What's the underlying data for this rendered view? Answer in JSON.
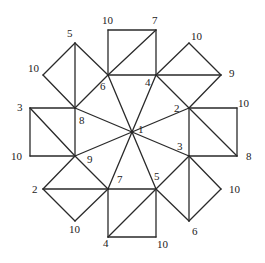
{
  "diagram": {
    "type": "graph",
    "vertices": [
      {
        "id": "c",
        "label": "1",
        "x": 132,
        "y": 132,
        "lx": 138,
        "ly": 133
      },
      {
        "id": "o6",
        "label": "6",
        "x": 108,
        "y": 75,
        "lx": 100,
        "ly": 90
      },
      {
        "id": "o4",
        "label": "4",
        "x": 156,
        "y": 75,
        "lx": 145,
        "ly": 86
      },
      {
        "id": "o2",
        "label": "2",
        "x": 189,
        "y": 108,
        "lx": 174,
        "ly": 112
      },
      {
        "id": "o3",
        "label": "3",
        "x": 189,
        "y": 156,
        "lx": 177,
        "ly": 150
      },
      {
        "id": "o5",
        "label": "5",
        "x": 156,
        "y": 189,
        "lx": 154,
        "ly": 180
      },
      {
        "id": "o7",
        "label": "7",
        "x": 108,
        "y": 189,
        "lx": 117,
        "ly": 183
      },
      {
        "id": "o9",
        "label": "9",
        "x": 75,
        "y": 156,
        "lx": 87,
        "ly": 163
      },
      {
        "id": "o8",
        "label": "8",
        "x": 75,
        "y": 108,
        "lx": 79,
        "ly": 124
      },
      {
        "id": "t10",
        "label": "10",
        "x": 108,
        "y": 30,
        "lx": 102,
        "ly": 24
      },
      {
        "id": "t7",
        "label": "7",
        "x": 156,
        "y": 30,
        "lx": 152,
        "ly": 24
      },
      {
        "id": "ur10",
        "label": "10",
        "x": 189,
        "y": 43,
        "lx": 191,
        "ly": 40
      },
      {
        "id": "ur9",
        "label": "9",
        "x": 221,
        "y": 75,
        "lx": 229,
        "ly": 77
      },
      {
        "id": "r10",
        "label": "10",
        "x": 237,
        "y": 108,
        "lx": 238,
        "ly": 107
      },
      {
        "id": "r8",
        "label": "8",
        "x": 237,
        "y": 156,
        "lx": 246,
        "ly": 160
      },
      {
        "id": "lr10",
        "label": "10",
        "x": 221,
        "y": 189,
        "lx": 229,
        "ly": 193
      },
      {
        "id": "lr6",
        "label": "6",
        "x": 189,
        "y": 221,
        "lx": 192,
        "ly": 235
      },
      {
        "id": "b10",
        "label": "10",
        "x": 156,
        "y": 237,
        "lx": 157,
        "ly": 248
      },
      {
        "id": "b4",
        "label": "4",
        "x": 108,
        "y": 237,
        "lx": 103,
        "ly": 247
      },
      {
        "id": "ll10",
        "label": "10",
        "x": 75,
        "y": 221,
        "lx": 69,
        "ly": 233
      },
      {
        "id": "ll2",
        "label": "2",
        "x": 43,
        "y": 189,
        "lx": 32,
        "ly": 193
      },
      {
        "id": "l10",
        "label": "10",
        "x": 30,
        "y": 156,
        "lx": 11,
        "ly": 160
      },
      {
        "id": "l3",
        "label": "3",
        "x": 30,
        "y": 108,
        "lx": 17,
        "ly": 111
      },
      {
        "id": "ul10",
        "label": "10",
        "x": 43,
        "y": 75,
        "lx": 28,
        "ly": 72
      },
      {
        "id": "ul5",
        "label": "5",
        "x": 75,
        "y": 43,
        "lx": 67,
        "ly": 37
      }
    ],
    "edges": [
      [
        "c",
        "o6"
      ],
      [
        "c",
        "o4"
      ],
      [
        "c",
        "o2"
      ],
      [
        "c",
        "o3"
      ],
      [
        "c",
        "o5"
      ],
      [
        "c",
        "o7"
      ],
      [
        "c",
        "o9"
      ],
      [
        "c",
        "o8"
      ],
      [
        "o6",
        "o4"
      ],
      [
        "o4",
        "o2"
      ],
      [
        "o2",
        "o3"
      ],
      [
        "o3",
        "o5"
      ],
      [
        "o5",
        "o7"
      ],
      [
        "o7",
        "o9"
      ],
      [
        "o9",
        "o8"
      ],
      [
        "o8",
        "o6"
      ],
      [
        "o6",
        "t10"
      ],
      [
        "t10",
        "t7"
      ],
      [
        "t7",
        "o4"
      ],
      [
        "o6",
        "t7"
      ],
      [
        "o4",
        "ur10"
      ],
      [
        "ur10",
        "ur9"
      ],
      [
        "ur9",
        "o2"
      ],
      [
        "o4",
        "ur9"
      ],
      [
        "o2",
        "r10"
      ],
      [
        "r10",
        "r8"
      ],
      [
        "r8",
        "o3"
      ],
      [
        "o2",
        "r8"
      ],
      [
        "o3",
        "lr10"
      ],
      [
        "lr10",
        "lr6"
      ],
      [
        "lr6",
        "o5"
      ],
      [
        "o3",
        "lr6"
      ],
      [
        "o5",
        "b10"
      ],
      [
        "b10",
        "b4"
      ],
      [
        "b4",
        "o7"
      ],
      [
        "b4",
        "o5"
      ],
      [
        "o7",
        "ll10"
      ],
      [
        "ll10",
        "ll2"
      ],
      [
        "ll2",
        "o9"
      ],
      [
        "ll2",
        "o7"
      ],
      [
        "o9",
        "l10"
      ],
      [
        "l10",
        "l3"
      ],
      [
        "l3",
        "o8"
      ],
      [
        "l3",
        "o9"
      ],
      [
        "o8",
        "ul10"
      ],
      [
        "ul10",
        "ul5"
      ],
      [
        "ul5",
        "o6"
      ],
      [
        "ul5",
        "o8"
      ]
    ],
    "colors": {
      "line": "#2a2a2a",
      "text": "#222222",
      "background": "#ffffff"
    }
  }
}
